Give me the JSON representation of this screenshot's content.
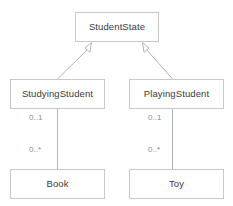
{
  "diagram": {
    "type": "uml-class-diagram",
    "canvas": {
      "width": 233,
      "height": 206
    },
    "colors": {
      "background": "#ffffff",
      "box_border": "#c8c8c8",
      "box_fill": "#ffffff",
      "class_text": "#3a3a3a",
      "connector_line": "#b4b4b4",
      "multiplicity_text": "#8e8e8e"
    },
    "classes": [
      {
        "id": "student-state",
        "name": "StudentState",
        "x": 75,
        "y": 12,
        "width": 84,
        "height": 30
      },
      {
        "id": "studying-student",
        "name": "StudyingStudent",
        "x": 10,
        "y": 79,
        "width": 95,
        "height": 30
      },
      {
        "id": "playing-student",
        "name": "PlayingStudent",
        "x": 129,
        "y": 79,
        "width": 95,
        "height": 30
      },
      {
        "id": "book",
        "name": "Book",
        "x": 10,
        "y": 169,
        "width": 95,
        "height": 30
      },
      {
        "id": "toy",
        "name": "Toy",
        "x": 129,
        "y": 169,
        "width": 95,
        "height": 30
      }
    ],
    "generalizations": [
      {
        "id": "gen-studying",
        "from": "StudyingStudent",
        "to": "StudentState",
        "arrow": "hollow-triangle"
      },
      {
        "id": "gen-playing",
        "from": "PlayingStudent",
        "to": "StudentState",
        "arrow": "hollow-triangle"
      }
    ],
    "associations": [
      {
        "id": "assoc-studying-book",
        "from": "StudyingStudent",
        "to": "Book",
        "source_multiplicity": "0..1",
        "target_multiplicity": "0..*"
      },
      {
        "id": "assoc-playing-toy",
        "from": "PlayingStudent",
        "to": "Toy",
        "source_multiplicity": "0..1",
        "target_multiplicity": "0..*"
      }
    ],
    "multiplicity_labels": [
      {
        "id": "mult-studying-book-source",
        "text": "0..1",
        "x": 29,
        "y": 114
      },
      {
        "id": "mult-studying-book-target",
        "text": "0..*",
        "x": 29,
        "y": 146
      },
      {
        "id": "mult-playing-toy-source",
        "text": "0..1",
        "x": 148,
        "y": 114
      },
      {
        "id": "mult-playing-toy-target",
        "text": "0..*",
        "x": 148,
        "y": 146
      }
    ]
  }
}
